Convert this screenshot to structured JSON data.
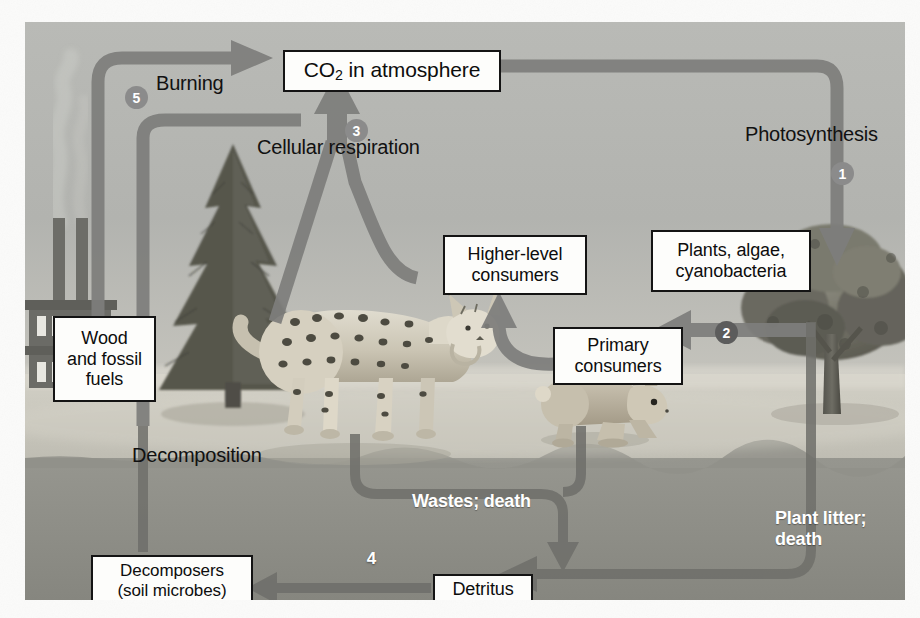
{
  "diagram": {
    "type": "cycle-diagram",
    "panel": {
      "x": 25,
      "y": 22,
      "width": 880,
      "height": 578
    }
  },
  "palette": {
    "sky": "#b4b5b1",
    "ground": "#cdcbc2",
    "soil": "#8e8e8a",
    "arrow": "#7e7e7c",
    "arrow_dark": "#6d6d6b",
    "box_fill": "#fdfdfb",
    "box_stroke": "#141414",
    "badge": "#8b8b8b",
    "badge_dark": "#5c5c5c",
    "text": "#0d0d0d",
    "text_white": "#ffffff",
    "paper": "#fbfbfa"
  },
  "boxes": [
    {
      "id": "co2",
      "label": "CO2 in atmosphere",
      "html": "CO<sub>2</sub> in atmosphere",
      "x": 258,
      "y": 28,
      "w": 218,
      "h": 42,
      "font": 21
    },
    {
      "id": "higher",
      "label": "Higher-level consumers",
      "html": "Higher-level<br>consumers",
      "x": 418,
      "y": 213,
      "w": 144,
      "h": 60,
      "font": 18
    },
    {
      "id": "plants",
      "label": "Plants, algae, cyanobacteria",
      "html": "Plants, algae,<br>cyanobacteria",
      "x": 626,
      "y": 208,
      "w": 160,
      "h": 62,
      "font": 18
    },
    {
      "id": "primary",
      "label": "Primary consumers",
      "html": "Primary<br>consumers",
      "x": 528,
      "y": 305,
      "w": 130,
      "h": 58,
      "font": 18
    },
    {
      "id": "wood",
      "label": "Wood and fossil fuels",
      "html": "Wood<br>and fossil<br>fuels",
      "x": 28,
      "y": 294,
      "w": 103,
      "h": 86,
      "font": 18
    },
    {
      "id": "decomposers",
      "label": "Decomposers (soil microbes)",
      "html": "Decomposers<br>(soil microbes)",
      "x": 66,
      "y": 533,
      "w": 162,
      "h": 51,
      "font": 17
    },
    {
      "id": "detritus",
      "label": "Detritus",
      "html": "Detritus",
      "x": 408,
      "y": 552,
      "w": 100,
      "h": 30,
      "font": 18
    }
  ],
  "labels": [
    {
      "id": "burning",
      "text": "Burning",
      "x": 131,
      "y": 62,
      "font": 20,
      "color": "dark",
      "align": "left"
    },
    {
      "id": "cellular-respiration",
      "text": "Cellular respiration",
      "x": 232,
      "y": 126,
      "font": 20,
      "color": "dark",
      "align": "left"
    },
    {
      "id": "photosynthesis",
      "text": "Photosynthesis",
      "x": 720,
      "y": 113,
      "font": 20,
      "color": "dark",
      "align": "left"
    },
    {
      "id": "decomposition",
      "text": "Decomposition",
      "x": 107,
      "y": 434,
      "font": 20,
      "color": "dark",
      "align": "left"
    },
    {
      "id": "wastes-death",
      "text": "Wastes; death",
      "x": 387,
      "y": 480,
      "font": 18,
      "color": "white",
      "align": "left"
    },
    {
      "id": "plant-litter-death",
      "text": "Plant litter;\ndeath",
      "line1": "Plant litter;",
      "line2": "death",
      "x": 750,
      "y": 497,
      "font": 18,
      "color": "white",
      "align": "left"
    }
  ],
  "badges": [
    {
      "id": "step-1",
      "number": "1",
      "x": 806,
      "y": 140,
      "style": "light",
      "step": "Photosynthesis"
    },
    {
      "id": "step-2",
      "number": "2",
      "x": 690,
      "y": 299,
      "style": "dark",
      "step": "Consumption by primary consumers"
    },
    {
      "id": "step-3",
      "number": "3",
      "x": 320,
      "y": 97,
      "style": "light",
      "step": "Cellular respiration"
    },
    {
      "id": "step-4",
      "number": "4",
      "x": 335,
      "y": 525,
      "style": "none",
      "step": "Decomposition of detritus"
    },
    {
      "id": "step-5",
      "number": "5",
      "x": 100,
      "y": 64,
      "style": "light",
      "step": "Burning of wood and fossil fuels"
    }
  ],
  "scenery": [
    {
      "id": "factory",
      "name": "factory-with-smokestacks"
    },
    {
      "id": "conifer-tree",
      "name": "conifer-tree"
    },
    {
      "id": "bobcat",
      "name": "bobcat-lynx"
    },
    {
      "id": "rabbit",
      "name": "rabbit"
    },
    {
      "id": "deciduous-tree",
      "name": "deciduous-tree"
    },
    {
      "id": "smoke",
      "name": "smoke-plume"
    }
  ],
  "flows": [
    {
      "id": "flow-burning",
      "from": "wood",
      "to": "co2",
      "label": "Burning",
      "step": 5
    },
    {
      "id": "flow-respiration",
      "from": "organisms",
      "to": "co2",
      "label": "Cellular respiration",
      "step": 3
    },
    {
      "id": "flow-photosynthesis",
      "from": "co2",
      "to": "plants",
      "label": "Photosynthesis",
      "step": 1
    },
    {
      "id": "flow-consumption",
      "from": "plants",
      "to": "primary",
      "label": "",
      "step": 2
    },
    {
      "id": "flow-predation",
      "from": "primary",
      "to": "higher",
      "label": "",
      "step": null
    },
    {
      "id": "flow-wastes",
      "from": "consumers",
      "to": "detritus",
      "label": "Wastes; death",
      "step": null
    },
    {
      "id": "flow-litter",
      "from": "plants",
      "to": "detritus",
      "label": "Plant litter; death",
      "step": null
    },
    {
      "id": "flow-decomposition",
      "from": "detritus",
      "to": "decomposers",
      "label": "",
      "step": 4
    },
    {
      "id": "flow-decomp-co2",
      "from": "decomposers",
      "to": "co2",
      "label": "Decomposition",
      "step": null
    }
  ]
}
